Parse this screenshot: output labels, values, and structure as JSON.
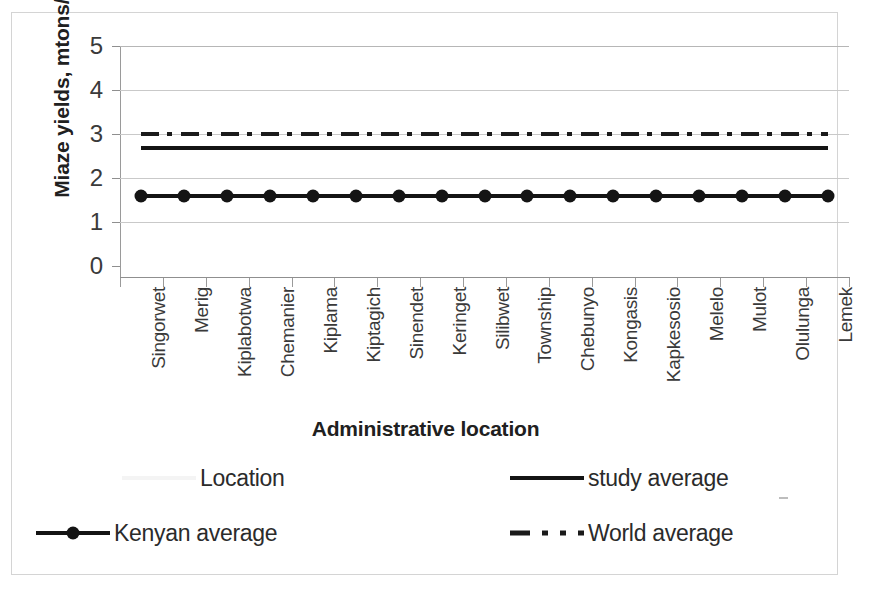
{
  "chart_data": {
    "type": "line",
    "title": "",
    "xlabel": "Administrative location",
    "ylabel": "Miaze yields, mtons/Ha",
    "ylim": [
      0,
      5
    ],
    "yticks": [
      0,
      1,
      2,
      3,
      4,
      5
    ],
    "grid": true,
    "legend_position": "bottom",
    "categories": [
      "Singorwet",
      "Merig",
      "Kiplabotwa",
      "Chemanier",
      "Kiplama",
      "Kiptagich",
      "Sinendet",
      "Keringet",
      "Silibwet",
      "Township",
      "Chebunyo",
      "Kongasis",
      "Kapkesosio",
      "Melelo",
      "Mulot",
      "Olulunga",
      "Lemek"
    ],
    "series": [
      {
        "name": "Location",
        "style": "none",
        "color": "#f4f4f4",
        "values": [
          null,
          null,
          null,
          null,
          null,
          null,
          null,
          null,
          null,
          null,
          null,
          null,
          null,
          null,
          null,
          null,
          null
        ]
      },
      {
        "name": "study average",
        "style": "solid",
        "color": "#141414",
        "values": [
          2.7,
          2.7,
          2.7,
          2.7,
          2.7,
          2.7,
          2.7,
          2.7,
          2.7,
          2.7,
          2.7,
          2.7,
          2.7,
          2.7,
          2.7,
          2.7,
          2.7
        ]
      },
      {
        "name": "Kenyan average",
        "style": "solid-marker",
        "color": "#141414",
        "values": [
          1.6,
          1.6,
          1.6,
          1.6,
          1.6,
          1.6,
          1.6,
          1.6,
          1.6,
          1.6,
          1.6,
          1.6,
          1.6,
          1.6,
          1.6,
          1.6,
          1.6
        ]
      },
      {
        "name": "World average",
        "style": "dash-dot",
        "color": "#1a1a1a",
        "values": [
          3.0,
          3.0,
          3.0,
          3.0,
          3.0,
          3.0,
          3.0,
          3.0,
          3.0,
          3.0,
          3.0,
          3.0,
          3.0,
          3.0,
          3.0,
          3.0,
          3.0
        ]
      }
    ]
  },
  "axes": {
    "y_title": "Miaze yields, mtons/Ha",
    "x_title": "Administrative location",
    "y_ticks": [
      "5",
      "4",
      "3",
      "2",
      "1",
      "0"
    ]
  },
  "legend": {
    "items": [
      {
        "label": "Location",
        "swatch": "faint-line"
      },
      {
        "label": "study average",
        "swatch": "solid-line"
      },
      {
        "label": "Kenyan average",
        "swatch": "solid-line-with-dot"
      },
      {
        "label": "World average",
        "swatch": "dash-dot-line"
      }
    ]
  },
  "colors": {
    "plot_line": "#141414",
    "gridline": "#c9c9c9",
    "axis": "#8f8f8f",
    "frame": "#d4d4d4",
    "background": "#ffffff"
  }
}
